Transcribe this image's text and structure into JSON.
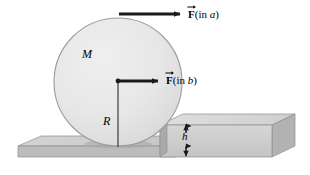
{
  "figure": {
    "labels": {
      "mass": "M",
      "radius": "R",
      "step_height": "h",
      "force_a_symbol": "F",
      "force_a_qualifier": "(in ",
      "force_a_case": "a",
      "force_a_close": ")",
      "force_b_symbol": "F",
      "force_b_qualifier": "(in ",
      "force_b_case": "b",
      "force_b_close": ")"
    },
    "colors": {
      "wheel_fill": "#e6e6e6",
      "wheel_stroke": "#9a9a9a",
      "slab_top": "#cccccc",
      "slab_front": "#bdbdbd",
      "slab_side": "#a8a8a8",
      "step_top": "#d8d8d8",
      "step_front": "#cfcfcf",
      "step_side": "#b4b4b4",
      "line": "#1a1a1a",
      "shadow": "#9d9d9d",
      "background": "#ffffff"
    },
    "icons": {
      "force_arrow_a": "right-arrow-icon",
      "force_arrow_b": "right-arrow-icon",
      "height_dimension": "double-headed-vertical-arrow-icon",
      "center_dot": "center-point-dot-icon",
      "radius_line": "radius-line-icon"
    }
  }
}
